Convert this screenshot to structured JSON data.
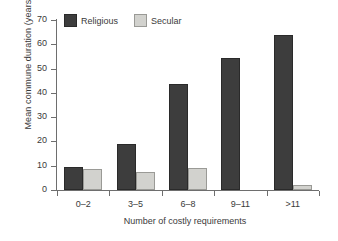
{
  "chart_data": {
    "type": "bar",
    "title": "",
    "xlabel": "Number of costly requirements",
    "ylabel": "Mean commune duration (years)",
    "categories": [
      "0–2",
      "3–5",
      "6–8",
      "9–11",
      ">11"
    ],
    "series": [
      {
        "name": "Religious",
        "color": "#3d3d3d",
        "values": [
          9.3,
          19.0,
          43.5,
          54.5,
          64.0
        ]
      },
      {
        "name": "Secular",
        "color": "#d2d2ce",
        "values": [
          8.5,
          7.5,
          9.2,
          0,
          2.0
        ]
      }
    ],
    "ylim": [
      0,
      70
    ],
    "yticks": [
      0,
      10,
      20,
      30,
      40,
      50,
      60,
      70
    ],
    "grid": false,
    "legend_position": "top-left"
  }
}
